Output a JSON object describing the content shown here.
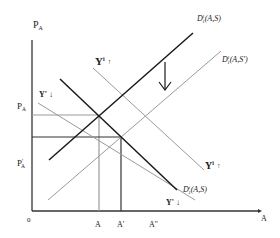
{
  "diagram": {
    "axes": {
      "y_label": "P",
      "y_label_sub": "A",
      "x_label": "A",
      "origin_label": "0"
    },
    "price_levels": [
      {
        "label": "P",
        "sub": "A",
        "prime": "",
        "id": "pa"
      },
      {
        "label": "P",
        "sub": "A",
        "prime": "'",
        "id": "pa-prime"
      }
    ],
    "quantity_levels": [
      {
        "label": "A",
        "id": "a"
      },
      {
        "label": "A'",
        "id": "a-prime"
      },
      {
        "label": "A''",
        "id": "a-double-prime"
      }
    ],
    "curves": {
      "supply_initial": {
        "label": "D",
        "sup": "l",
        "sub": "1",
        "args": "(A,S)"
      },
      "supply_shifted": {
        "label": "D",
        "sup": "l",
        "sub": "1",
        "args": "(A,S')"
      },
      "demand": {
        "label": "D",
        "sup": "i",
        "sub": "1",
        "args": "(A,S)"
      }
    },
    "annotations": {
      "income_up_top": {
        "text": "Y",
        "sup": "i",
        "arrow": "↑"
      },
      "income_up_right": {
        "text": "Y",
        "sup": "i",
        "arrow": "↑"
      },
      "income_down_left": {
        "text": "Y'",
        "arrow": "↓"
      },
      "income_down_right": {
        "text": "Y'",
        "arrow": "↓"
      },
      "shift_arrow": "↓"
    },
    "colors": {
      "dark_line": "#1a1a1a",
      "gray_line": "#9a9a9a",
      "axis": "#333333"
    }
  }
}
